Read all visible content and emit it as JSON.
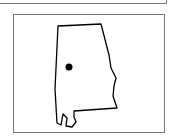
{
  "figure": {
    "marker": {
      "shape": "dot",
      "color": "#000000"
    },
    "outline_color": "#000000",
    "frame_color": "#777777"
  }
}
